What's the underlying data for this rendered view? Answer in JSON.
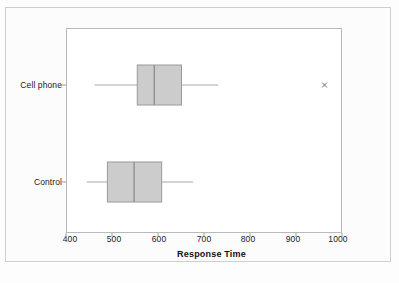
{
  "chart_data": {
    "type": "box",
    "orientation": "horizontal",
    "title": "",
    "xlabel": "Response Time",
    "ylabel": "",
    "xlim": [
      400,
      1000
    ],
    "xticks": [
      400,
      500,
      600,
      700,
      800,
      900,
      1000
    ],
    "xtick_labels": [
      "400",
      "500",
      "600",
      "700",
      "800",
      "900",
      "1000"
    ],
    "grid": false,
    "legend": "none",
    "categories": [
      "Cell phone",
      "Control"
    ],
    "boxes": [
      {
        "category": "Cell phone",
        "whisker_low": 462,
        "q1": 555,
        "median": 592,
        "q3": 651,
        "whisker_high": 731,
        "outliers": [
          962
        ]
      },
      {
        "category": "Control",
        "whisker_low": 445,
        "q1": 490,
        "median": 548,
        "q3": 608,
        "whisker_high": 676,
        "outliers": []
      }
    ],
    "colors": {
      "box_fill": "#cccccc",
      "box_stroke": "#9a9a9a",
      "median_stroke": "#8f8f8f",
      "whisker_stroke": "#a8a8a8",
      "outlier_stroke": "#6b6b6b",
      "panel_border": "#b9b9b9",
      "panel_background": "#ffffff",
      "page_background": "#fcfcfc",
      "text": "#1a1a1a"
    }
  },
  "axis": {
    "x_title": "Response Time",
    "tick_400": "400",
    "tick_500": "500",
    "tick_600": "600",
    "tick_700": "700",
    "tick_800": "800",
    "tick_900": "900",
    "tick_1000": "1000"
  },
  "categories": {
    "cell_phone": "Cell phone",
    "control": "Control"
  }
}
